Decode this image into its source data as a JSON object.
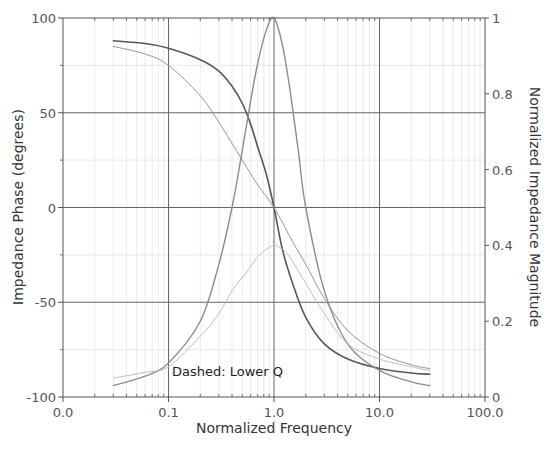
{
  "chart_data": {
    "type": "line",
    "title": "",
    "xlabel": "Normalized Frequency",
    "ylabel": "Impedance Phase (degrees)",
    "y2label": "Normalized Impedance Magnitude",
    "xscale": "log",
    "xlim": [
      0.01,
      100
    ],
    "ylim": [
      -100,
      100
    ],
    "y2lim": [
      0,
      1
    ],
    "grid": true,
    "x_ticks": [
      0.01,
      0.1,
      1,
      10,
      100
    ],
    "x_tick_labels": [
      "0.0",
      "0.1",
      "1.0",
      "10.0",
      "100.0"
    ],
    "y_ticks": [
      -100,
      -50,
      0,
      50,
      100
    ],
    "y_tick_labels": [
      "-100",
      "-50",
      "0",
      "50",
      "100"
    ],
    "y2_ticks": [
      0,
      0.2,
      0.4,
      0.6,
      0.8,
      1
    ],
    "y2_tick_labels": [
      "0",
      "0.2",
      "0.4",
      "0.6",
      "0.8",
      "1"
    ],
    "annotations": [
      {
        "text": "Dashed: Lower Q",
        "x": 0.04,
        "y": -85
      }
    ],
    "series": [
      {
        "name": "Phase (High Q)",
        "axis": "left",
        "style": "solid",
        "color": "#555566",
        "width": 1.6,
        "x": [
          0.03,
          0.06,
          0.1,
          0.2,
          0.3,
          0.4,
          0.5,
          0.6,
          0.7,
          0.85,
          1.0,
          1.2,
          1.5,
          2.0,
          3.0,
          5.0,
          10.0,
          20.0,
          30.0
        ],
        "values": [
          88,
          86.5,
          84,
          78,
          72,
          64,
          55,
          44,
          32,
          17,
          0,
          -22,
          -40,
          -58,
          -72,
          -80,
          -85,
          -87.3,
          -88
        ]
      },
      {
        "name": "Phase (Lower Q)",
        "axis": "left",
        "style": "dashed",
        "color": "#8a8a90",
        "width": 0.9,
        "x": [
          0.03,
          0.06,
          0.1,
          0.2,
          0.3,
          0.5,
          0.7,
          1.0,
          1.5,
          2.0,
          3.0,
          5.0,
          10.0,
          20.0,
          30.0
        ],
        "values": [
          85,
          81,
          75,
          59,
          45,
          25,
          12,
          0,
          -18,
          -30,
          -48,
          -65,
          -77,
          -83,
          -85
        ]
      },
      {
        "name": "Magnitude (High Q)",
        "axis": "right",
        "style": "solid",
        "color": "#8c8c8c",
        "width": 1.4,
        "x": [
          0.03,
          0.06,
          0.1,
          0.2,
          0.3,
          0.4,
          0.5,
          0.6,
          0.7,
          0.85,
          1.0,
          1.2,
          1.4,
          1.7,
          2.0,
          3.0,
          5.0,
          10.0,
          20.0,
          30.0
        ],
        "values": [
          0.03,
          0.055,
          0.09,
          0.2,
          0.35,
          0.5,
          0.65,
          0.78,
          0.88,
          0.97,
          1.0,
          0.93,
          0.82,
          0.65,
          0.5,
          0.28,
          0.14,
          0.07,
          0.04,
          0.03
        ]
      },
      {
        "name": "Magnitude (Lower Q)",
        "axis": "right",
        "style": "dashed",
        "color": "#b8b8b8",
        "width": 0.9,
        "x": [
          0.03,
          0.06,
          0.1,
          0.2,
          0.3,
          0.4,
          0.55,
          0.7,
          0.85,
          1.0,
          1.2,
          1.4,
          2.0,
          3.0,
          5.0,
          10.0,
          20.0,
          30.0
        ],
        "values": [
          0.05,
          0.065,
          0.08,
          0.16,
          0.22,
          0.28,
          0.33,
          0.37,
          0.39,
          0.4,
          0.39,
          0.37,
          0.3,
          0.22,
          0.14,
          0.1,
          0.08,
          0.07
        ]
      }
    ]
  },
  "colors": {
    "axis": "#555555",
    "major_grid": "#666666",
    "minor_grid": "#e4e4e4",
    "background": "#ffffff"
  },
  "plot_area": {
    "left": 63,
    "top": 18,
    "right": 485,
    "bottom": 397
  }
}
